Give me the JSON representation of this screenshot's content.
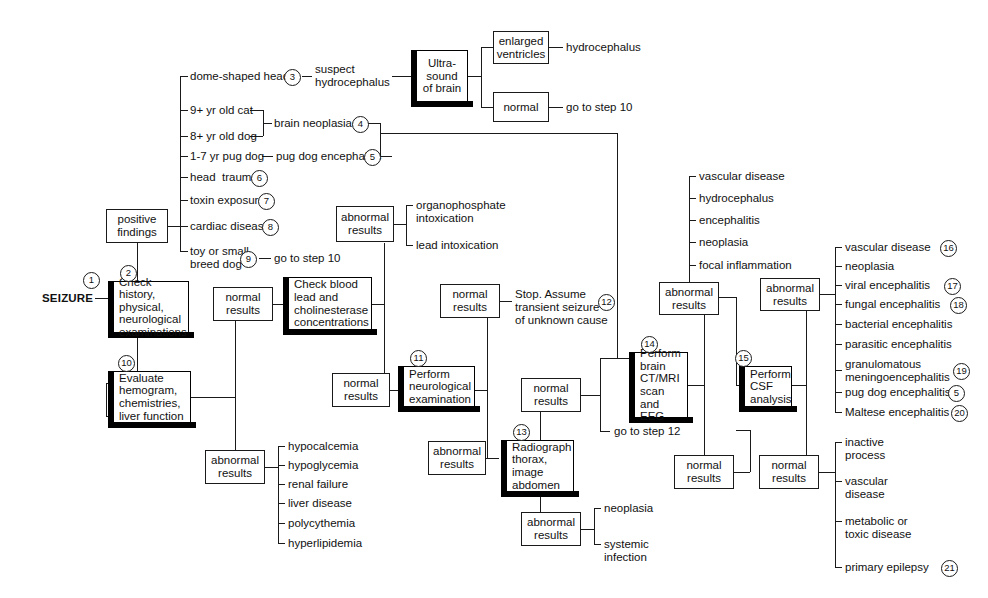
{
  "diagram": {
    "entry_label": "SEIZURE",
    "boxes": {
      "check_history": "Check history,\nphysical,\nneurological\nexaminations",
      "positive_findings": "positive\nfindings",
      "negative_findings": "negative\nfindings",
      "evaluate_hemogram": "Evaluate\nhemogram,\nchemistries,\nliver function",
      "ultrasound": "Ultra-\nsound\nof brain",
      "enlarged_ventricles": "enlarged\nventricles",
      "us_normal": "normal",
      "chem_normal": "normal\nresults",
      "chem_abnormal": "abnormal\nresults",
      "check_blood_lead": "Check blood\nlead and\ncholinesterase\nconcentrations",
      "tox_abnormal": "abnormal\nresults",
      "tox_normal": "normal\nresults",
      "perform_neuro": "Perform\nneurological\nexamination",
      "neuro_normal": "normal\nresults",
      "neuro_abnormal": "abnormal\nresults",
      "radiograph": "Radiograph\nthorax,\nimage\nabdomen",
      "rad_normal": "normal\nresults",
      "rad_abnormal": "abnormal\nresults",
      "ct_mri": "Perform\nbrain\nCT/MRI\nscan and\nEEG",
      "ct_abnormal": "abnormal\nresults",
      "ct_normal": "normal\nresults",
      "csf": "Perform\nCSF\nanalysis",
      "csf_abnormal": "abnormal\nresults",
      "csf_normal": "normal\nresults"
    },
    "leaves": {
      "dome_shaped_head": "dome-shaped head",
      "suspect_hydrocephalus": "suspect\nhydrocephalus",
      "cat_9yr": "9+ yr old cat",
      "dog_8yr": "8+ yr old dog",
      "brain_neoplasia": "brain neoplasia",
      "pug_dog_1_7": "1-7 yr pug dog",
      "pug_dog_encephalitis": "pug dog encephalitis",
      "head_trauma": "head  trauma",
      "toxin_exposure": "toxin exposure",
      "cardiac_disease": "cardiac disease",
      "toy_small_breed": "toy or small\nbreed dog",
      "go_to_step_10_a": "go to step 10",
      "hydrocephalus_us": "hydrocephalus",
      "go_to_step_10_b": "go to step 10",
      "organophosphate": "organophosphate\nintoxication",
      "lead_intoxication": "lead intoxication",
      "stop_transient": "Stop. Assume\ntransient seizure\nof unknown cause",
      "go_to_step_12": "go to step 12",
      "hypocalcemia": "hypocalcemia",
      "hypoglycemia": "hypoglycemia",
      "renal_failure": "renal failure",
      "liver_disease": "liver disease",
      "polycythemia": "polycythemia",
      "hyperlipidemia": "hyperlipidemia",
      "neoplasia_rad": "neoplasia",
      "systemic_infection": "systemic\ninfection",
      "ct_vascular_disease": "vascular disease",
      "ct_hydrocephalus": "hydrocephalus",
      "ct_encephalitis": "encephalitis",
      "ct_neoplasia": "neoplasia",
      "ct_focal_inflammation": "focal inflammation",
      "csf_vascular_disease": "vascular disease",
      "csf_neoplasia": "neoplasia",
      "csf_viral": "viral encephalitis",
      "csf_fungal": "fungal encephalitis",
      "csf_bacterial": "bacterial encephalitis",
      "csf_parasitic": "parasitic encephalitis",
      "csf_granulomatous": "granulomatous\nmeningoencephalitis",
      "csf_pug": "pug dog encephalitis",
      "csf_maltese": "Maltese encephalitis",
      "inactive_process": "inactive\nprocess",
      "final_vascular_disease": "vascular\ndisease",
      "metabolic_toxic": "metabolic or\ntoxic disease",
      "primary_epilepsy": "primary epilepsy"
    },
    "step_numbers": {
      "n1": "1",
      "n2": "2",
      "n3": "3",
      "n4": "4",
      "n5": "5",
      "n6": "6",
      "n7": "7",
      "n8": "8",
      "n9": "9",
      "n10": "10",
      "n11": "11",
      "n12": "12",
      "n13": "13",
      "n14": "14",
      "n15": "15",
      "n16": "16",
      "n17": "17",
      "n18": "18",
      "n19": "19",
      "n20": "20",
      "n5b": "5",
      "n21": "21"
    },
    "colors": {
      "line": "#1a1a1a",
      "text": "#111111",
      "shadow": "#000000",
      "background": "#ffffff"
    }
  }
}
